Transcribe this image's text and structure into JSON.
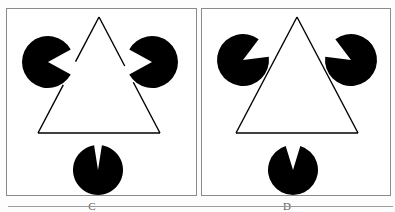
{
  "figure": {
    "type": "kanizsa-illusory-triangle",
    "background": "#ffffff",
    "ink": "#000000",
    "frame_color": "#8a8a8a",
    "panel_count": 2
  },
  "panels": [
    {
      "id": "C",
      "label": "C",
      "box": {
        "x": 6,
        "y": 8,
        "w": 191,
        "h": 188
      },
      "label_pos": {
        "x": 92,
        "y": 201
      },
      "description": "Three black pac-man discs with wedges aimed at the shared centre, plus a thin outlined triangle whose edges are interrupted where the discs sit.",
      "discs": [
        {
          "name": "disc-top-left",
          "cx": 48,
          "cy": 62,
          "r": 26,
          "wedge_center_deg": 0,
          "wedge_width_deg": 58
        },
        {
          "name": "disc-top-right",
          "cx": 152,
          "cy": 62,
          "r": 26,
          "wedge_center_deg": 180,
          "wedge_width_deg": 58
        },
        {
          "name": "disc-bottom",
          "cx": 98,
          "cy": 170,
          "r": 25,
          "wedge_center_deg": 270,
          "wedge_width_deg": 18
        }
      ],
      "triangle": {
        "name": "outline-triangle",
        "apex": {
          "x": 99,
          "y": 17
        },
        "bottom_left": {
          "x": 38,
          "y": 133
        },
        "bottom_right": {
          "x": 160,
          "y": 133
        },
        "stroke_width": 1.4,
        "gap_note": "edges break where they pass behind the three discs"
      }
    },
    {
      "id": "D",
      "label": "D",
      "box": {
        "x": 201,
        "y": 8,
        "w": 190,
        "h": 188
      },
      "label_pos": {
        "x": 287,
        "y": 201
      },
      "description": "Same layout, but the upper discs' wedges are rotated to point down-inward and the bottom disc's wedge is wider.",
      "discs": [
        {
          "name": "disc-top-left",
          "cx": 243,
          "cy": 60,
          "r": 26,
          "wedge_center_deg": 330,
          "wedge_width_deg": 46
        },
        {
          "name": "disc-top-right",
          "cx": 351,
          "cy": 60,
          "r": 26,
          "wedge_center_deg": 210,
          "wedge_width_deg": 46
        },
        {
          "name": "disc-bottom",
          "cx": 293,
          "cy": 170,
          "r": 25,
          "wedge_center_deg": 270,
          "wedge_width_deg": 34
        }
      ],
      "triangle": {
        "name": "outline-triangle",
        "apex": {
          "x": 297,
          "y": 17
        },
        "bottom_left": {
          "x": 236,
          "y": 133
        },
        "bottom_right": {
          "x": 358,
          "y": 133
        },
        "stroke_width": 1.4,
        "gap_note": "edges break where they pass behind the three discs"
      }
    }
  ],
  "baseline": {
    "x": 8,
    "y": 206,
    "w": 385
  }
}
